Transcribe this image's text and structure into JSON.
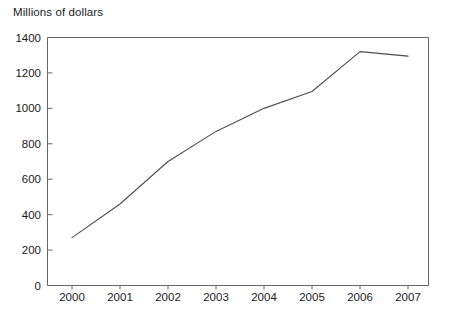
{
  "chart_data": {
    "type": "line",
    "title": "Millions of dollars",
    "subtitle": "",
    "xlabel": "",
    "ylabel": "Millions of dollars",
    "x": [
      2000,
      2001,
      2002,
      2003,
      2004,
      2005,
      2006,
      2007
    ],
    "categories": [
      "2000",
      "2001",
      "2002",
      "2003",
      "2004",
      "2005",
      "2006",
      "2007"
    ],
    "values": [
      270,
      460,
      700,
      870,
      1000,
      1095,
      1320,
      1295
    ],
    "series": [
      {
        "name": "Millions of dollars",
        "values": [
          270,
          460,
          700,
          870,
          1000,
          1095,
          1320,
          1295
        ]
      }
    ],
    "ylim": [
      0,
      1400
    ],
    "yticks": [
      0,
      200,
      400,
      600,
      800,
      1000,
      1200,
      1400
    ],
    "ytick_labels": [
      "0",
      "200",
      "400",
      "600",
      "800",
      "1000",
      "1200",
      "1400"
    ],
    "xtick_labels": [
      "2000",
      "2001",
      "2002",
      "2003",
      "2004",
      "2005",
      "2006",
      "2007"
    ],
    "grid": false,
    "legend": false,
    "legend_position": "none",
    "line_color": "#4d4d4d",
    "axis_color": "#666666",
    "background_color": "#ffffff"
  },
  "axis": {
    "y_title": "Millions of dollars"
  }
}
